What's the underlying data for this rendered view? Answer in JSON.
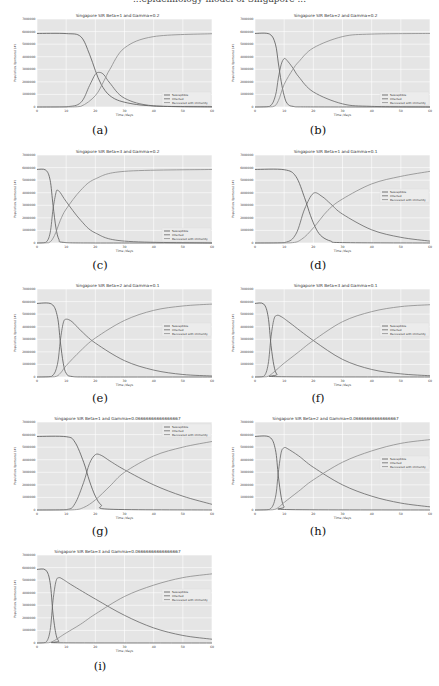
{
  "figure": {
    "top_cut_text": "...epidemiology model of Singapore ...",
    "x_label": "Time /days",
    "y_label": "Population /(persons) (#)",
    "legend": [
      "Susceptible",
      "Infected",
      "Recovered with immunity"
    ],
    "colors": {
      "background": "#e5e5e5",
      "grid": "#ffffff",
      "susceptible": "#555555",
      "infected": "#666666",
      "recovered": "#8a8a8a"
    }
  },
  "chart_data": [
    {
      "id": "a",
      "type": "line",
      "title": "Singapore SIR Beta=1 and Gamma=0.2",
      "caption": "(a)",
      "xlabel": "Time /days",
      "ylabel": "Population /(persons) (#)",
      "xlim": [
        0,
        60
      ],
      "ylim": [
        0,
        7000000
      ],
      "xticks": [
        0,
        10,
        20,
        30,
        40,
        50,
        60
      ],
      "yticks": [
        0,
        1000000,
        2000000,
        3000000,
        4000000,
        5000000,
        6000000,
        7000000
      ],
      "grid": true,
      "legend_position": "lower right",
      "beta": 1,
      "gamma": 0.2,
      "series": [
        {
          "name": "Susceptible",
          "x": [
            0,
            10,
            15,
            18,
            20,
            22,
            25,
            30,
            40,
            60
          ],
          "values": [
            5850000,
            5840000,
            5600000,
            4200000,
            2900000,
            1800000,
            900000,
            380000,
            80000,
            20000
          ]
        },
        {
          "name": "Infected",
          "x": [
            0,
            10,
            15,
            18,
            20,
            21.5,
            23,
            25,
            30,
            40,
            60
          ],
          "values": [
            0,
            20000,
            350000,
            1700000,
            2600000,
            2750000,
            2550000,
            1900000,
            700000,
            90000,
            0
          ]
        },
        {
          "name": "Recovered with immunity",
          "x": [
            0,
            10,
            15,
            20,
            23,
            25,
            30,
            40,
            60
          ],
          "values": [
            0,
            0,
            50000,
            900000,
            2100000,
            3000000,
            4700000,
            5600000,
            5830000
          ]
        }
      ]
    },
    {
      "id": "b",
      "type": "line",
      "title": "Singapore SIR Beta=2 and Gamma=0.2",
      "caption": "(b)",
      "xlabel": "Time /days",
      "ylabel": "Population /(persons) (#)",
      "xlim": [
        0,
        60
      ],
      "ylim": [
        0,
        7000000
      ],
      "xticks": [
        0,
        10,
        20,
        30,
        40,
        50,
        60
      ],
      "yticks": [
        0,
        1000000,
        2000000,
        3000000,
        4000000,
        5000000,
        6000000,
        7000000
      ],
      "grid": true,
      "legend_position": "lower right",
      "beta": 2,
      "gamma": 0.2,
      "series": [
        {
          "name": "Susceptible",
          "x": [
            0,
            5,
            7,
            8,
            9,
            10,
            11,
            13,
            20,
            60
          ],
          "values": [
            5850000,
            5800000,
            5000000,
            3500000,
            2000000,
            900000,
            300000,
            50000,
            5000,
            0
          ]
        },
        {
          "name": "Infected",
          "x": [
            0,
            5,
            7,
            8,
            9,
            10,
            11,
            13,
            15,
            20,
            30,
            40,
            60
          ],
          "values": [
            0,
            50000,
            900000,
            2300000,
            3400000,
            3850000,
            3700000,
            3100000,
            2400000,
            1200000,
            250000,
            50000,
            0
          ]
        },
        {
          "name": "Recovered with immunity",
          "x": [
            0,
            6,
            8,
            10,
            13,
            15,
            20,
            30,
            40,
            60
          ],
          "values": [
            0,
            20000,
            500000,
            1800000,
            3000000,
            3600000,
            4700000,
            5600000,
            5800000,
            5850000
          ]
        }
      ]
    },
    {
      "id": "c",
      "type": "line",
      "title": "Singapore SIR Beta=3 and Gamma=0.2",
      "caption": "(c)",
      "xlabel": "Time /days",
      "ylabel": "Population /(persons) (#)",
      "xlim": [
        0,
        60
      ],
      "ylim": [
        0,
        7000000
      ],
      "xticks": [
        0,
        10,
        20,
        30,
        40,
        50,
        60
      ],
      "yticks": [
        0,
        1000000,
        2000000,
        3000000,
        4000000,
        5000000,
        6000000,
        7000000
      ],
      "grid": true,
      "legend_position": "lower right",
      "beta": 3,
      "gamma": 0.2,
      "series": [
        {
          "name": "Susceptible",
          "x": [
            0,
            3,
            4.5,
            5.5,
            6.5,
            7.5,
            9,
            20,
            60
          ],
          "values": [
            5850000,
            5800000,
            5000000,
            3000000,
            1200000,
            300000,
            50000,
            0,
            0
          ]
        },
        {
          "name": "Infected",
          "x": [
            0,
            3,
            4.5,
            5.5,
            6.5,
            7,
            8,
            10,
            15,
            20,
            30,
            60
          ],
          "values": [
            0,
            50000,
            800000,
            2700000,
            4000000,
            4200000,
            4000000,
            3300000,
            1800000,
            800000,
            150000,
            0
          ]
        },
        {
          "name": "Recovered with immunity",
          "x": [
            0,
            4,
            6,
            8,
            10,
            15,
            20,
            30,
            60
          ],
          "values": [
            0,
            20000,
            600000,
            1800000,
            2700000,
            4200000,
            5100000,
            5700000,
            5850000
          ]
        }
      ]
    },
    {
      "id": "d",
      "type": "line",
      "title": "Singapore SIR Beta=1 and Gamma=0.1",
      "caption": "(d)",
      "xlabel": "Time /days",
      "ylabel": "Population /(persons) (#)",
      "xlim": [
        0,
        60
      ],
      "ylim": [
        0,
        7000000
      ],
      "xticks": [
        0,
        10,
        20,
        30,
        40,
        50,
        60
      ],
      "yticks": [
        0,
        1000000,
        2000000,
        3000000,
        4000000,
        5000000,
        6000000,
        7000000
      ],
      "grid": true,
      "legend_position": "center right",
      "beta": 1,
      "gamma": 0.1,
      "series": [
        {
          "name": "Susceptible",
          "x": [
            0,
            10,
            14,
            17,
            19,
            21,
            23,
            26,
            30,
            60
          ],
          "values": [
            5850000,
            5830000,
            5300000,
            3600000,
            2200000,
            1100000,
            500000,
            150000,
            30000,
            0
          ]
        },
        {
          "name": "Infected",
          "x": [
            0,
            10,
            14,
            17,
            20,
            23,
            26,
            30,
            40,
            50,
            60
          ],
          "values": [
            0,
            30000,
            700000,
            2700000,
            3950000,
            3700000,
            3100000,
            2300000,
            1050000,
            450000,
            150000
          ]
        },
        {
          "name": "Recovered with immunity",
          "x": [
            0,
            12,
            16,
            20,
            25,
            30,
            40,
            50,
            60
          ],
          "values": [
            0,
            10000,
            300000,
            1200000,
            2600000,
            3500000,
            4700000,
            5300000,
            5700000
          ]
        }
      ]
    },
    {
      "id": "e",
      "type": "line",
      "title": "Singapore SIR Beta=2 and Gamma=0.1",
      "caption": "(e)",
      "xlabel": "Time /days",
      "ylabel": "Population /(persons) (#)",
      "xlim": [
        0,
        60
      ],
      "ylim": [
        0,
        7000000
      ],
      "xticks": [
        0,
        10,
        20,
        30,
        40,
        50,
        60
      ],
      "yticks": [
        0,
        1000000,
        2000000,
        3000000,
        4000000,
        5000000,
        6000000,
        7000000
      ],
      "grid": true,
      "legend_position": "center right",
      "beta": 2,
      "gamma": 0.1,
      "series": [
        {
          "name": "Susceptible",
          "x": [
            0,
            5,
            7,
            8,
            9,
            10,
            12,
            20,
            60
          ],
          "values": [
            5850000,
            5800000,
            4800000,
            2800000,
            1100000,
            300000,
            40000,
            0,
            0
          ]
        },
        {
          "name": "Infected",
          "x": [
            0,
            5,
            7,
            8,
            9,
            10,
            12,
            15,
            20,
            30,
            40,
            50,
            60
          ],
          "values": [
            0,
            50000,
            1000000,
            2900000,
            4300000,
            4600000,
            4400000,
            3700000,
            2700000,
            1300000,
            550000,
            200000,
            80000
          ]
        },
        {
          "name": "Recovered with immunity",
          "x": [
            0,
            6,
            8,
            10,
            15,
            20,
            30,
            40,
            50,
            60
          ],
          "values": [
            0,
            20000,
            300000,
            900000,
            2100000,
            3100000,
            4500000,
            5300000,
            5650000,
            5800000
          ]
        }
      ]
    },
    {
      "id": "f",
      "type": "line",
      "title": "Singapore SIR Beta=3 and Gamma=0.1",
      "caption": "(f)",
      "xlabel": "Time /days",
      "ylabel": "Population /(persons) (#)",
      "xlim": [
        0,
        60
      ],
      "ylim": [
        0,
        7000000
      ],
      "xticks": [
        0,
        10,
        20,
        30,
        40,
        50,
        60
      ],
      "yticks": [
        0,
        1000000,
        2000000,
        3000000,
        4000000,
        5000000,
        6000000,
        7000000
      ],
      "grid": true,
      "legend_position": "center right",
      "beta": 3,
      "gamma": 0.1,
      "series": [
        {
          "name": "Susceptible",
          "x": [
            0,
            3,
            4.5,
            5.5,
            6.5,
            7.5,
            9,
            60
          ],
          "values": [
            5850000,
            5800000,
            4800000,
            2500000,
            900000,
            200000,
            20000,
            0
          ]
        },
        {
          "name": "Infected",
          "x": [
            0,
            3,
            4.5,
            5.5,
            6.5,
            7.5,
            9,
            12,
            20,
            30,
            40,
            50,
            60
          ],
          "values": [
            0,
            50000,
            1000000,
            3200000,
            4600000,
            4900000,
            4800000,
            4300000,
            2900000,
            1400000,
            600000,
            250000,
            100000
          ]
        },
        {
          "name": "Recovered with immunity",
          "x": [
            0,
            4,
            6,
            8,
            10,
            15,
            20,
            30,
            40,
            50,
            60
          ],
          "values": [
            0,
            20000,
            300000,
            700000,
            1100000,
            2000000,
            2900000,
            4400000,
            5200000,
            5600000,
            5750000
          ]
        }
      ]
    },
    {
      "id": "g",
      "type": "line",
      "title": "Singapore SIR Beta=1 and Gamma=0.06666666666666667",
      "caption": "(g)",
      "xlabel": "Time /days",
      "ylabel": "Population /(persons) (#)",
      "xlim": [
        0,
        60
      ],
      "ylim": [
        0,
        7000000
      ],
      "xticks": [
        0,
        10,
        20,
        30,
        40,
        50,
        60
      ],
      "yticks": [
        0,
        1000000,
        2000000,
        3000000,
        4000000,
        5000000,
        6000000,
        7000000
      ],
      "grid": true,
      "legend_position": "upper right",
      "beta": 1,
      "gamma": 0.06666666666666667,
      "series": [
        {
          "name": "Susceptible",
          "x": [
            0,
            10,
            13,
            16,
            18,
            20,
            22,
            25,
            60
          ],
          "values": [
            5850000,
            5830000,
            5400000,
            3800000,
            2300000,
            1100000,
            400000,
            60000,
            0
          ]
        },
        {
          "name": "Infected",
          "x": [
            0,
            10,
            13,
            16,
            18,
            20,
            22,
            25,
            30,
            40,
            50,
            60
          ],
          "values": [
            0,
            30000,
            500000,
            2200000,
            3700000,
            4400000,
            4350000,
            3900000,
            3200000,
            2000000,
            1100000,
            450000
          ]
        },
        {
          "name": "Recovered with immunity",
          "x": [
            0,
            12,
            16,
            20,
            25,
            30,
            40,
            50,
            60
          ],
          "values": [
            0,
            10000,
            200000,
            800000,
            1900000,
            3000000,
            4300000,
            5000000,
            5450000
          ]
        }
      ]
    },
    {
      "id": "h",
      "type": "line",
      "title": "Singapore SIR Beta=2 and Gamma=0.06666666666666667",
      "caption": "(h)",
      "xlabel": "Time /days",
      "ylabel": "Population /(persons) (#)",
      "xlim": [
        0,
        60
      ],
      "ylim": [
        0,
        7000000
      ],
      "xticks": [
        0,
        10,
        20,
        30,
        40,
        50,
        60
      ],
      "yticks": [
        0,
        1000000,
        2000000,
        3000000,
        4000000,
        5000000,
        6000000,
        7000000
      ],
      "grid": true,
      "legend_position": "center right",
      "beta": 2,
      "gamma": 0.06666666666666667,
      "series": [
        {
          "name": "Susceptible",
          "x": [
            0,
            5,
            7,
            8,
            9,
            10,
            12,
            60
          ],
          "values": [
            5850000,
            5800000,
            4800000,
            2700000,
            1000000,
            250000,
            30000,
            0
          ]
        },
        {
          "name": "Infected",
          "x": [
            0,
            5,
            7,
            8,
            9,
            10,
            11,
            15,
            20,
            30,
            40,
            50,
            60
          ],
          "values": [
            0,
            50000,
            1000000,
            3000000,
            4600000,
            4950000,
            4900000,
            4300000,
            3400000,
            2000000,
            1100000,
            550000,
            250000
          ]
        },
        {
          "name": "Recovered with immunity",
          "x": [
            0,
            6,
            8,
            10,
            15,
            20,
            30,
            40,
            50,
            60
          ],
          "values": [
            0,
            20000,
            200000,
            600000,
            1500000,
            2400000,
            3800000,
            4700000,
            5300000,
            5600000
          ]
        }
      ]
    },
    {
      "id": "i",
      "type": "line",
      "title": "Singapore SIR Beta=3 and Gamma=0.06666666666666667",
      "caption": "(i)",
      "xlabel": "Time /days",
      "ylabel": "Population /(persons) (#)",
      "xlim": [
        0,
        60
      ],
      "ylim": [
        0,
        7000000
      ],
      "xticks": [
        0,
        10,
        20,
        30,
        40,
        50,
        60
      ],
      "yticks": [
        0,
        1000000,
        2000000,
        3000000,
        4000000,
        5000000,
        6000000,
        7000000
      ],
      "grid": true,
      "legend_position": "center right",
      "beta": 3,
      "gamma": 0.06666666666666667,
      "series": [
        {
          "name": "Susceptible",
          "x": [
            0,
            3,
            4.5,
            5.5,
            6.5,
            7.5,
            9,
            60
          ],
          "values": [
            5850000,
            5800000,
            4800000,
            2300000,
            700000,
            150000,
            10000,
            0
          ]
        },
        {
          "name": "Infected",
          "x": [
            0,
            3,
            4.5,
            5.5,
            6.5,
            7.5,
            9,
            12,
            20,
            30,
            40,
            50,
            60
          ],
          "values": [
            0,
            50000,
            1000000,
            3400000,
            4900000,
            5200000,
            5050000,
            4600000,
            3500000,
            2200000,
            1200000,
            600000,
            300000
          ]
        },
        {
          "name": "Recovered with immunity",
          "x": [
            0,
            4,
            6,
            8,
            10,
            15,
            20,
            30,
            40,
            50,
            60
          ],
          "values": [
            0,
            20000,
            200000,
            500000,
            800000,
            1500000,
            2300000,
            3700000,
            4600000,
            5200000,
            5500000
          ]
        }
      ]
    }
  ]
}
